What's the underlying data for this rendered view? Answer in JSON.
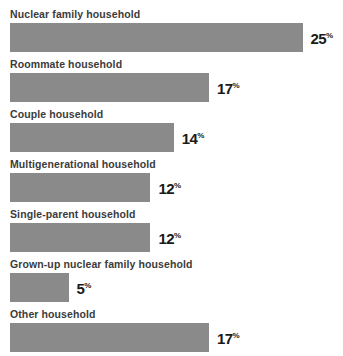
{
  "chart_data": {
    "type": "bar",
    "orientation": "horizontal",
    "title": "",
    "subtitle": "",
    "xlabel": "",
    "ylabel": "",
    "grid": false,
    "legend": null,
    "xlim": [
      0,
      25
    ],
    "value_suffix": "%",
    "categories": [
      "Nuclear family household",
      "Roommate household",
      "Couple household",
      "Multigenerational household",
      "Single-parent household",
      "Grown-up nuclear family household",
      "Other household"
    ],
    "values": [
      25,
      17,
      14,
      12,
      12,
      5,
      17
    ],
    "value_labels": [
      "25",
      "17",
      "14",
      "12",
      "12",
      "5",
      "17"
    ],
    "bars": [
      {
        "label": "Nuclear family household",
        "value": 25,
        "value_label": "25",
        "suffix": "%"
      },
      {
        "label": "Roommate household",
        "value": 17,
        "value_label": "17",
        "suffix": "%"
      },
      {
        "label": "Couple household",
        "value": 14,
        "value_label": "14",
        "suffix": "%"
      },
      {
        "label": "Multigenerational household",
        "value": 12,
        "value_label": "12",
        "suffix": "%"
      },
      {
        "label": "Single-parent household",
        "value": 12,
        "value_label": "12",
        "suffix": "%"
      },
      {
        "label": "Grown-up nuclear family household",
        "value": 5,
        "value_label": "5",
        "suffix": "%"
      },
      {
        "label": "Other household",
        "value": 17,
        "value_label": "17",
        "suffix": "%"
      }
    ]
  },
  "colors": {
    "bar": "#8a8a8a",
    "label_text": "#3b3b3b",
    "value_text": "#1a1a1a",
    "background": "#ffffff"
  }
}
